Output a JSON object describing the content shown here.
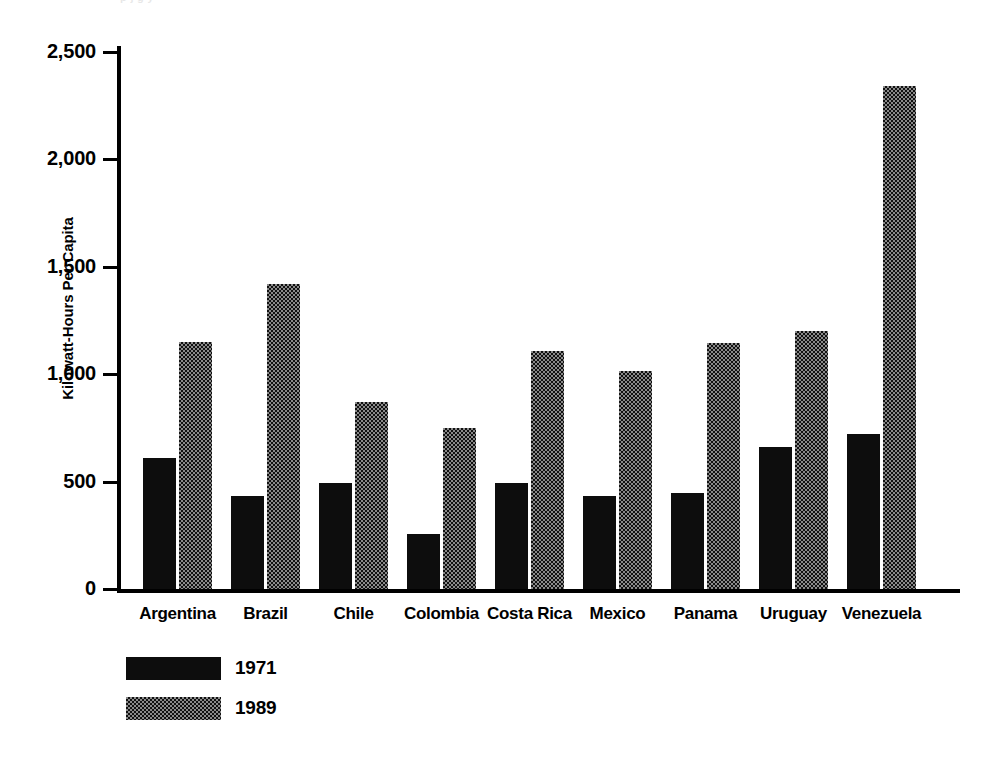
{
  "chart_data": {
    "type": "bar",
    "title": "",
    "subtitle": "",
    "xlabel": "",
    "ylabel": "Kilowatt-Hours Per Capita",
    "ylim": [
      0,
      2500
    ],
    "ytick_labels": [
      "0",
      "500",
      "1,000",
      "1,500",
      "2,000",
      "2,500"
    ],
    "ytick_values": [
      0,
      500,
      1000,
      1500,
      2000,
      2500
    ],
    "grid": false,
    "legend_position": "bottom-left",
    "categories": [
      "Argentina",
      "Brazil",
      "Chile",
      "Colombia",
      "Costa Rica",
      "Mexico",
      "Panama",
      "Uruguay",
      "Venezuela"
    ],
    "series": [
      {
        "name": "1971",
        "fill": "solid-black",
        "color": "#0d0d0d",
        "values": [
          610,
          435,
          495,
          255,
          495,
          435,
          445,
          660,
          720
        ]
      },
      {
        "name": "1989",
        "fill": "checkered",
        "color": "#8a8a8a",
        "values": [
          1150,
          1420,
          870,
          750,
          1110,
          1015,
          1145,
          1200,
          2340
        ]
      }
    ]
  },
  "axis": {
    "y_title": "Kilowatt-Hours Per Capita"
  },
  "legend": {
    "items": [
      {
        "label": "1971"
      },
      {
        "label": "1989"
      }
    ]
  },
  "top_sliver": {
    "text": "p j g y"
  }
}
